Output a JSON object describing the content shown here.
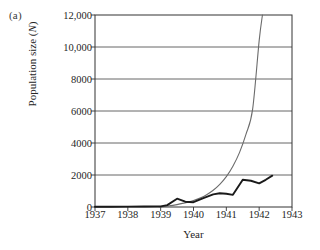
{
  "panel": {
    "label": "(a)"
  },
  "chart_data": {
    "type": "line",
    "title": "",
    "xlabel": "Year",
    "ylabel": "Population size (N)",
    "ylabel_plain": "Population size (N)",
    "xlim": [
      1937,
      1943
    ],
    "ylim": [
      0,
      12000
    ],
    "grid": true,
    "legend_position": "none",
    "xticks": [
      "1937",
      "1938",
      "1939",
      "1940",
      "1941",
      "1942",
      "1943"
    ],
    "xtick_values": [
      1937,
      1938,
      1939,
      1940,
      1941,
      1942,
      1943
    ],
    "yticks": [
      "0",
      "2000",
      "4000",
      "6000",
      "8000",
      "10,000",
      "12,000"
    ],
    "ytick_values": [
      0,
      2000,
      4000,
      6000,
      8000,
      10000,
      12000
    ],
    "colors": {
      "observed": "#1a1a1a",
      "model": "#6b6b6b",
      "grid": "#555555",
      "axis": "#333333"
    },
    "series": [
      {
        "name": "Observed population",
        "style": "thick-black-jagged",
        "x": [
          1937.0,
          1937.5,
          1938.0,
          1938.5,
          1939.0,
          1939.2,
          1939.5,
          1939.75,
          1940.0,
          1940.3,
          1940.6,
          1940.8,
          1941.0,
          1941.2,
          1941.5,
          1941.75,
          1942.0,
          1942.2,
          1942.4
        ],
        "values": [
          20,
          20,
          25,
          30,
          40,
          120,
          520,
          330,
          300,
          560,
          790,
          860,
          830,
          760,
          1700,
          1640,
          1480,
          1700,
          1960
        ]
      },
      {
        "name": "Exponential model",
        "style": "thin-gray-smooth",
        "x": [
          1938.95,
          1939.2,
          1939.5,
          1939.8,
          1940.0,
          1940.2,
          1940.4,
          1940.6,
          1940.8,
          1941.0,
          1941.2,
          1941.4,
          1941.6,
          1941.8,
          1942.0,
          1942.1
        ],
        "values": [
          0,
          55,
          150,
          290,
          400,
          560,
          770,
          1050,
          1420,
          1900,
          2550,
          3400,
          4550,
          6100,
          10400,
          12000
        ]
      }
    ]
  }
}
